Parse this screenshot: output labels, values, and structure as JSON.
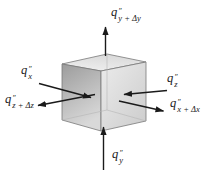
{
  "figure": {
    "labels": {
      "q_y_plus_dy": {
        "base": "q",
        "sup": "″",
        "sub": "y + Δy"
      },
      "q_x": {
        "base": "q",
        "sup": "″",
        "sub": "x"
      },
      "q_z_plus_dz": {
        "base": "q",
        "sup": "″",
        "sub": "z + Δz"
      },
      "q_z": {
        "base": "q",
        "sup": "″",
        "sub": "z"
      },
      "q_x_plus_dx": {
        "base": "q",
        "sup": "″",
        "sub": "x + Δx"
      },
      "q_y": {
        "base": "q",
        "sup": "″",
        "sub": "y"
      }
    },
    "colors": {
      "background": "#ffffff",
      "arrow": "#1a1a1a",
      "label_text": "#1a1a1a",
      "cube_edge": "#787878",
      "cube_hidden_edge": "#b5b5b5",
      "left_face_dark": "#a0a0a0",
      "left_face_light": "#d9d9d9",
      "right_face_light": "#ebebeb",
      "right_face_dark": "#cccccc",
      "top_face_light": "#f1f1f1",
      "top_face_dark": "#dadada"
    }
  }
}
